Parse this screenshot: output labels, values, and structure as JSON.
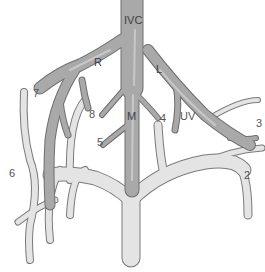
{
  "diagram": {
    "type": "anatomical-vessel-diagram",
    "colors": {
      "hepatic_fill": "#a9a9a9",
      "hepatic_highlight": "#c8c8c8",
      "hepatic_outline": "#6e6e6e",
      "portal_fill": "#e4e4e4",
      "portal_outline": "#7a7a7a",
      "label": "#555555",
      "background": "#ffffff"
    },
    "labels": {
      "ivc": "IVC",
      "right": "R",
      "left": "L",
      "middle": "M",
      "umbilical": "UV",
      "seg2": "2",
      "seg3": "3",
      "seg4": "4",
      "seg5": "5",
      "seg6": "6",
      "seg7": "7",
      "seg8": "8"
    }
  }
}
